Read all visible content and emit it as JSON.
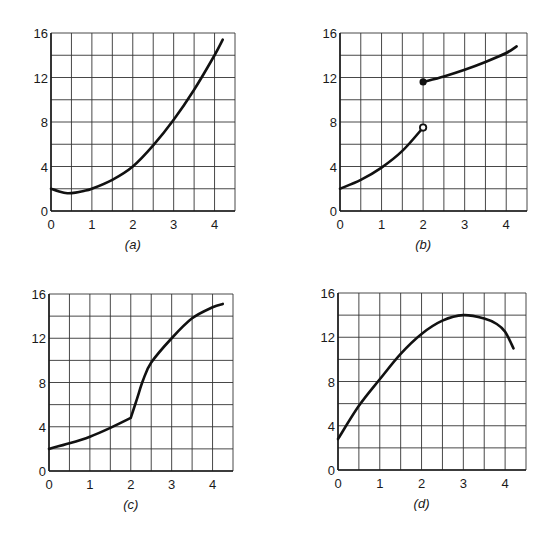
{
  "chart_data": [
    {
      "type": "line",
      "title": "",
      "caption": "(a)",
      "xlabel": "",
      "ylabel": "",
      "xlim": [
        0,
        4.5
      ],
      "ylim": [
        0,
        16
      ],
      "xticks": [
        "0",
        "1",
        "2",
        "3",
        "4"
      ],
      "yticks": [
        "0",
        "4",
        "8",
        "12",
        "16"
      ],
      "grid": true,
      "series": [
        {
          "name": "f(x)",
          "x": [
            0,
            0.2,
            0.4,
            0.6,
            0.8,
            1.0,
            1.5,
            2.0,
            2.5,
            3.0,
            3.5,
            4.0,
            4.2
          ],
          "y": [
            2.0,
            1.75,
            1.6,
            1.65,
            1.8,
            2.0,
            2.8,
            4.0,
            5.9,
            8.2,
            10.9,
            14.0,
            15.4
          ]
        }
      ]
    },
    {
      "type": "line",
      "title": "",
      "caption": "(b)",
      "xlabel": "",
      "ylabel": "",
      "xlim": [
        0,
        4.5
      ],
      "ylim": [
        0,
        16
      ],
      "xticks": [
        "0",
        "1",
        "2",
        "3",
        "4"
      ],
      "yticks": [
        "0",
        "4",
        "8",
        "12",
        "16"
      ],
      "grid": true,
      "series": [
        {
          "name": "left branch",
          "x": [
            0,
            0.5,
            1.0,
            1.5,
            2.0
          ],
          "y": [
            2.0,
            2.8,
            3.9,
            5.4,
            7.5
          ],
          "end_marker": "open-circle"
        },
        {
          "name": "right branch",
          "x": [
            2.0,
            2.5,
            3.0,
            3.5,
            4.0,
            4.25
          ],
          "y": [
            11.6,
            12.1,
            12.7,
            13.4,
            14.2,
            14.8
          ],
          "start_marker": "filled-circle"
        }
      ]
    },
    {
      "type": "line",
      "title": "",
      "caption": "(c)",
      "xlabel": "",
      "ylabel": "",
      "xlim": [
        0,
        4.5
      ],
      "ylim": [
        0,
        16
      ],
      "xticks": [
        "0",
        "1",
        "2",
        "3",
        "4"
      ],
      "yticks": [
        "0",
        "4",
        "8",
        "12",
        "16"
      ],
      "grid": true,
      "series": [
        {
          "name": "f(x)",
          "x": [
            0,
            0.5,
            1.0,
            1.5,
            2.0,
            2.15,
            2.3,
            2.5,
            3.0,
            3.5,
            4.0,
            4.25
          ],
          "y": [
            2.0,
            2.5,
            3.1,
            3.9,
            4.8,
            6.5,
            8.2,
            9.8,
            12.0,
            13.8,
            14.8,
            15.1
          ]
        }
      ]
    },
    {
      "type": "line",
      "title": "",
      "caption": "(d)",
      "xlabel": "",
      "ylabel": "",
      "xlim": [
        0,
        4.5
      ],
      "ylim": [
        0,
        16
      ],
      "xticks": [
        "0",
        "1",
        "2",
        "3",
        "4"
      ],
      "yticks": [
        "0",
        "4",
        "8",
        "12",
        "16"
      ],
      "grid": true,
      "series": [
        {
          "name": "f(x)",
          "x": [
            0,
            0.5,
            1.0,
            1.5,
            2.0,
            2.5,
            3.0,
            3.5,
            3.8,
            4.0,
            4.2
          ],
          "y": [
            2.8,
            5.8,
            8.2,
            10.5,
            12.3,
            13.5,
            14.0,
            13.7,
            13.2,
            12.5,
            11.0
          ]
        }
      ]
    }
  ]
}
